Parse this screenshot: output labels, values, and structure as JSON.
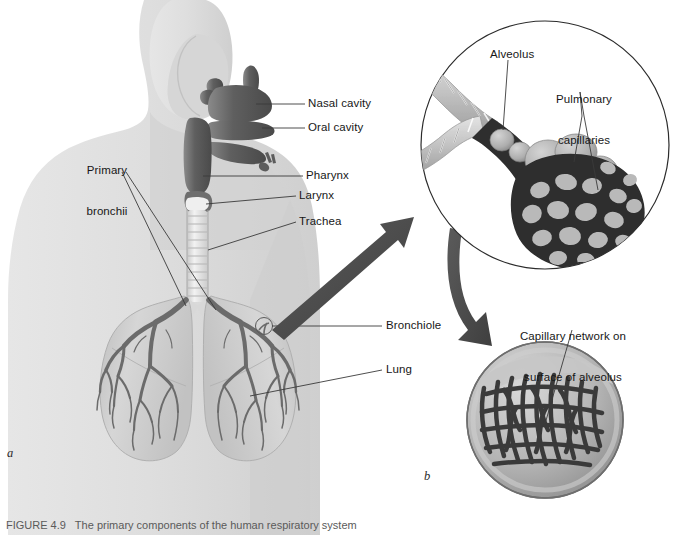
{
  "figure": {
    "caption": "FIGURE 4.9   The primary components of the human respiratory system",
    "panel_a_letter": "a",
    "panel_b_letter": "b"
  },
  "labels": {
    "nasal_cavity": "Nasal cavity",
    "oral_cavity": "Oral cavity",
    "pharynx": "Pharynx",
    "larynx": "Larynx",
    "trachea": "Trachea",
    "primary_bronchii_line1": "Primary",
    "primary_bronchii_line2": "bronchii",
    "bronchiole": "Bronchiole",
    "lung": "Lung",
    "alveolus": "Alveolus",
    "pulmonary_capillaries_line1": "Pulmonary",
    "pulmonary_capillaries_line2": "capillaries",
    "capillary_network_line1": "Capillary network on",
    "capillary_network_line2": "surface of alveolus"
  },
  "colors": {
    "background": "#ffffff",
    "body_silhouette": "#dedede",
    "body_silhouette_shade": "#d2d2d2",
    "airway_dark": "#5d5d5d",
    "airway_mid": "#777777",
    "cartilage_light": "#e9e9e9",
    "lung_fill": "#c9c9c9",
    "lung_fill_light": "#d8d8d8",
    "bronchial_tree": "#6b6b6b",
    "arrow": "#4f4f4f",
    "leader_line": "#3a3a3a",
    "inset_outline": "#2b2b2b",
    "capillary_dark": "#3a3a3a",
    "alveoli_fill": "#b5b5b5",
    "alveoli_light": "#cfcfcf",
    "text": "#171717"
  },
  "icons": {
    "pointer_arrow": "arrow-icon",
    "curved_arrow": "curved-arrow-icon"
  }
}
